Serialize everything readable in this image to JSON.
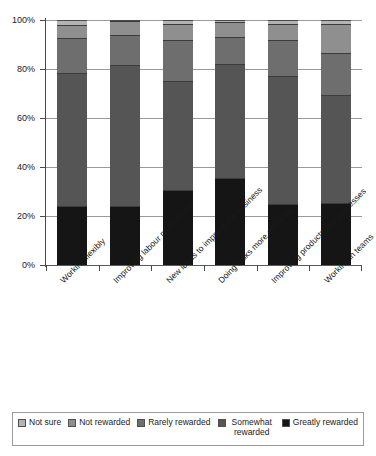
{
  "chart_data": {
    "type": "bar",
    "subtype": "stacked-100-percent",
    "title": "",
    "xlabel": "",
    "ylabel": "",
    "ylim": [
      0,
      100
    ],
    "ytick_labels": [
      "0%",
      "20%",
      "40%",
      "60%",
      "80%",
      "100%"
    ],
    "ytick_values": [
      0,
      20,
      40,
      60,
      80,
      100
    ],
    "grid": true,
    "legend_position": "bottom",
    "categories": [
      "Working flexibly",
      "Improving labour productivity",
      "New ideas to improve the business",
      "Doing tasks more efficiently",
      "Improving products and processes",
      "Working in teams"
    ],
    "series": [
      {
        "name": "Greatly rewarded",
        "color": "#151515",
        "values": [
          24.0,
          24.0,
          30.5,
          35.5,
          25.0,
          25.5
        ]
      },
      {
        "name": "Somewhat rewarded",
        "color": "#555555",
        "values": [
          54.5,
          57.5,
          44.5,
          46.5,
          52.0,
          44.0
        ]
      },
      {
        "name": "Rarely rewarded",
        "color": "#6e6e6e",
        "values": [
          14.0,
          12.5,
          17.0,
          11.0,
          15.0,
          17.0
        ]
      },
      {
        "name": "Not rewarded",
        "color": "#8f8f8f",
        "values": [
          5.5,
          5.5,
          6.5,
          6.0,
          6.5,
          12.0
        ]
      },
      {
        "name": "Not sure",
        "color": "#b3b3b3",
        "values": [
          2.0,
          0.5,
          1.5,
          1.0,
          1.5,
          1.5
        ]
      }
    ],
    "legend_entries": [
      {
        "label": "Not sure",
        "color": "#b3b3b3"
      },
      {
        "label": "Not rewarded",
        "color": "#8f8f8f"
      },
      {
        "label": "Rarely rewarded",
        "color": "#6e6e6e"
      },
      {
        "label": "Somewhat rewarded",
        "color": "#555555"
      },
      {
        "label": "Greatly rewarded",
        "color": "#151515"
      }
    ]
  }
}
